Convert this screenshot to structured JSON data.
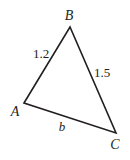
{
  "diagram": {
    "type": "triangle",
    "vertices": [
      {
        "name": "A",
        "x": 24,
        "y": 103,
        "label_x": 15,
        "label_y": 116
      },
      {
        "name": "B",
        "x": 70,
        "y": 27,
        "label_x": 69,
        "label_y": 20
      },
      {
        "name": "C",
        "x": 116,
        "y": 133,
        "label_x": 115,
        "label_y": 149
      }
    ],
    "sides": [
      {
        "name": "AB",
        "label": "1.2",
        "label_x": 41,
        "label_y": 58
      },
      {
        "name": "BC",
        "label": "1.5",
        "label_x": 102,
        "label_y": 77
      },
      {
        "name": "AC",
        "label": "b",
        "label_x": 62,
        "label_y": 131
      }
    ],
    "stroke_color": "#231f20",
    "text_color": "#231f20"
  }
}
